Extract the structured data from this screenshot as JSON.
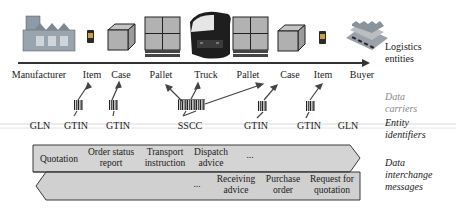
{
  "diagram": {
    "logistics_entities": [
      {
        "label": "Manufacturer",
        "icon": "factory-icon"
      },
      {
        "label": "Item",
        "icon": "item-icon"
      },
      {
        "label": "Case",
        "icon": "case-box-icon"
      },
      {
        "label": "Pallet",
        "icon": "pallet-icon"
      },
      {
        "label": "Truck",
        "icon": "truck-icon"
      },
      {
        "label": "Pallet",
        "icon": "pallet-icon"
      },
      {
        "label": "Case",
        "icon": "case-box-icon"
      },
      {
        "label": "Item",
        "icon": "item-icon"
      },
      {
        "label": "Buyer",
        "icon": "warehouse-icon"
      }
    ],
    "entity_identifiers": [
      "GLN",
      "GTIN",
      "GTIN",
      "SSCC",
      "GTIN",
      "GTIN",
      "GLN"
    ],
    "data_carriers": [
      "barcode",
      "barcode",
      "barcode",
      "barcode",
      "barcode"
    ],
    "forward_messages": [
      "Quotation",
      "Order status report",
      "Transport instruction",
      "Dispatch advice",
      "..."
    ],
    "forward_messages_lines": [
      [
        "Quotation"
      ],
      [
        "Order status",
        "report"
      ],
      [
        "Transport",
        "instruction"
      ],
      [
        "Dispatch",
        "advice"
      ],
      [
        "..."
      ]
    ],
    "backward_messages_lines": [
      [
        "..."
      ],
      [
        "Receiving",
        "advice"
      ],
      [
        "Purchase",
        "order"
      ],
      [
        "Request for",
        "quotation"
      ]
    ],
    "row_labels": {
      "logistics": [
        "Logistics",
        "entities"
      ],
      "carriers": [
        "Data",
        "carriers"
      ],
      "identifiers": [
        "Entity",
        "identifiers"
      ],
      "messages": [
        "Data",
        "interchange",
        "messages"
      ]
    },
    "colors": {
      "arrow_fill": "#d2d2d2",
      "arrow_stroke": "#3a3a3a",
      "timeline": "#333333",
      "icon_gray": "#a8a8a8",
      "carrier_label": "#8a8a8a"
    }
  }
}
